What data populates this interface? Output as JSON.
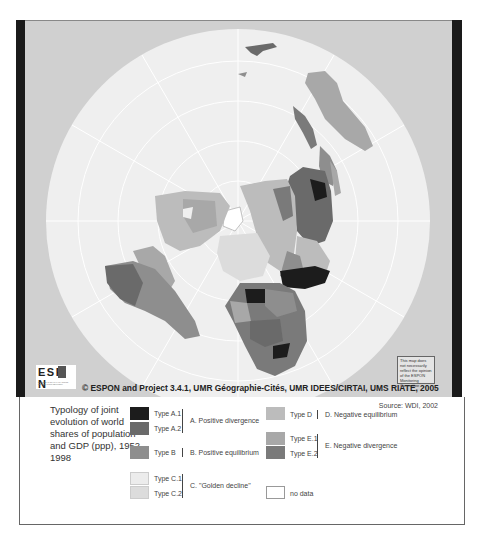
{
  "map": {
    "projection": "polar azimuthal",
    "background_color": "#d0d0d0",
    "ocean_color": "#efefef",
    "graticule_color": "#ffffff",
    "frame_bar_color": "#1a1a1a"
  },
  "logo": {
    "text": "ESP  N",
    "subtitle": "EUROPEAN SPATIAL PLANNING OBSERVATION NETWORK"
  },
  "copyright": "© ESPON and Project 3.4.1, UMR Géographie-Cités, UMR IDEES/CIRTAI, UMS RIATE, 2005",
  "disclaimer": "This map does not necessarily reflect the opinion of the ESPON Monitoring Committee",
  "legend": {
    "title": "Typology of joint evolution of world shares of population and GDP (ppp), 1952-1998",
    "source": "Source: WDI, 2002",
    "groups": [
      {
        "label": "A. Positive divergence",
        "items": [
          {
            "label": "Type A.1",
            "color": "#1c1c1c"
          },
          {
            "label": "Type A.2",
            "color": "#6a6a6a"
          }
        ]
      },
      {
        "label": "B. Positive equilibrium",
        "items": [
          {
            "label": "Type B",
            "color": "#8e8e8e"
          }
        ]
      },
      {
        "label": "C. \"Golden decline\"",
        "items": [
          {
            "label": "Type C.1",
            "color": "#ececec"
          },
          {
            "label": "Type C.2",
            "color": "#dcdcdc"
          }
        ]
      },
      {
        "label": "D. Negative equilibrium",
        "items": [
          {
            "label": "Type D",
            "color": "#bcbcbc"
          }
        ]
      },
      {
        "label": "E. Negative divergence",
        "items": [
          {
            "label": "Type E.1",
            "color": "#a8a8a8"
          },
          {
            "label": "Type E.2",
            "color": "#7a7a7a"
          }
        ]
      }
    ],
    "no_data": {
      "label": "no data",
      "color": "#ffffff"
    }
  }
}
